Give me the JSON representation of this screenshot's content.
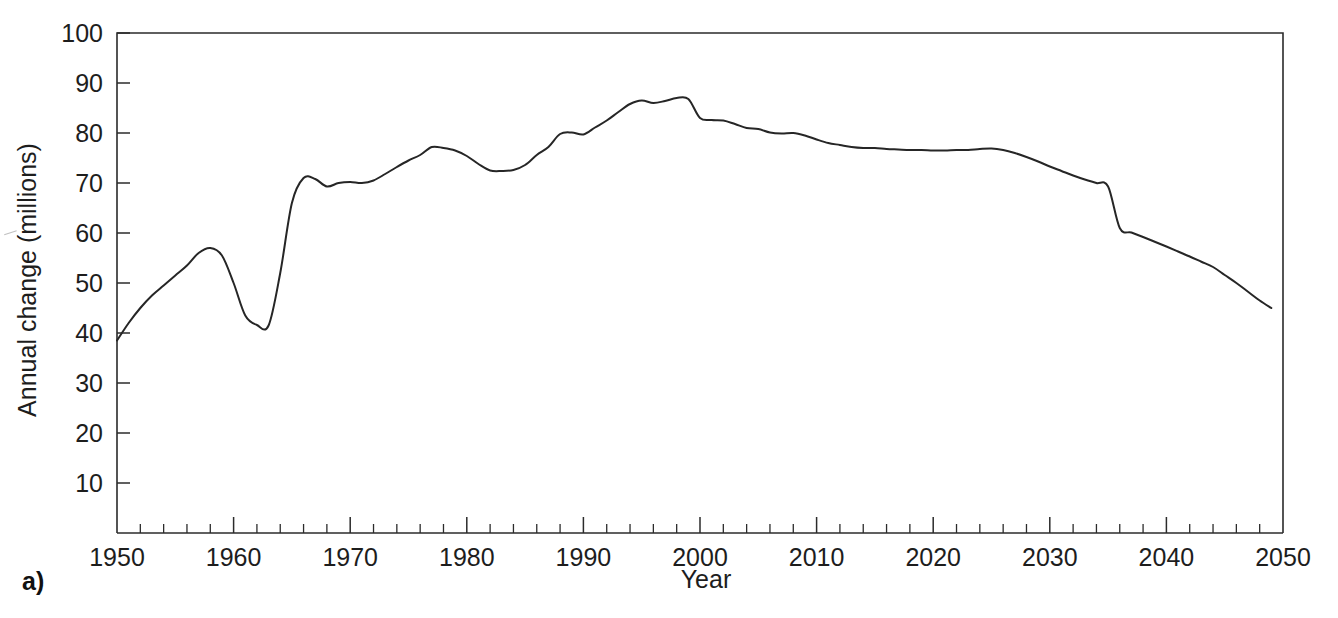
{
  "panel": {
    "label": "a)"
  },
  "chart_data": {
    "type": "line",
    "title": "",
    "xlabel": "Year",
    "ylabel": "Annual change (millions)",
    "xlim": [
      1950,
      2050
    ],
    "ylim": [
      0,
      100
    ],
    "grid": false,
    "legend": null,
    "x_major_ticks": [
      1950,
      1960,
      1970,
      1980,
      1990,
      2000,
      2010,
      2020,
      2030,
      2040,
      2050
    ],
    "x_minor_tick_interval": 2,
    "y_major_ticks": [
      10,
      20,
      30,
      40,
      50,
      60,
      70,
      80,
      90,
      100
    ],
    "x_ticklabels": [
      "1950",
      "1960",
      "1970",
      "1980",
      "1990",
      "2000",
      "2010",
      "2020",
      "2030",
      "2040",
      "2050"
    ],
    "y_ticklabels": [
      "10",
      "20",
      "30",
      "40",
      "50",
      "60",
      "70",
      "80",
      "90",
      "100"
    ],
    "series": [
      {
        "name": "Annual population change",
        "color": "#262626",
        "x": [
          1950,
          1951,
          1952,
          1953,
          1954,
          1955,
          1956,
          1957,
          1958,
          1959,
          1960,
          1961,
          1962,
          1963,
          1964,
          1965,
          1966,
          1967,
          1968,
          1969,
          1970,
          1971,
          1972,
          1973,
          1974,
          1975,
          1976,
          1977,
          1978,
          1979,
          1980,
          1981,
          1982,
          1983,
          1984,
          1985,
          1986,
          1987,
          1988,
          1989,
          1990,
          1991,
          1992,
          1993,
          1994,
          1995,
          1996,
          1997,
          1998,
          1999,
          2000,
          2001,
          2002,
          2003,
          2004,
          2005,
          2006,
          2007,
          2008,
          2009,
          2010,
          2011,
          2012,
          2013,
          2014,
          2015,
          2016,
          2017,
          2018,
          2019,
          2020,
          2021,
          2022,
          2023,
          2024,
          2025,
          2026,
          2027,
          2028,
          2029,
          2030,
          2031,
          2032,
          2033,
          2034,
          2035,
          2036,
          2037,
          2038,
          2039,
          2040,
          2041,
          2042,
          2043,
          2044,
          2045,
          2046,
          2047,
          2048,
          2049
        ],
        "values": [
          38.5,
          42.0,
          45.0,
          47.5,
          49.5,
          51.5,
          53.5,
          56.0,
          57.0,
          55.5,
          50.0,
          43.5,
          41.6,
          41.5,
          52.0,
          66.0,
          71.0,
          70.8,
          69.3,
          70.0,
          70.2,
          70.0,
          70.5,
          71.8,
          73.2,
          74.5,
          75.6,
          77.2,
          77.0,
          76.5,
          75.4,
          73.8,
          72.5,
          72.4,
          72.6,
          73.6,
          75.6,
          77.2,
          79.8,
          80.1,
          79.7,
          81.1,
          82.5,
          84.2,
          85.8,
          86.5,
          86.0,
          86.4,
          87.0,
          86.8,
          83.0,
          82.6,
          82.5,
          81.8,
          81.0,
          80.8,
          80.1,
          79.9,
          80.0,
          79.5,
          78.7,
          78.0,
          77.6,
          77.2,
          77.0,
          77.0,
          76.8,
          76.7,
          76.6,
          76.6,
          76.5,
          76.5,
          76.6,
          76.6,
          76.8,
          76.9,
          76.6,
          76.0,
          75.2,
          74.3,
          73.3,
          72.4,
          71.5,
          70.7,
          70.0,
          69.3,
          68.6,
          67.9,
          67.1,
          66.4,
          65.6,
          64.8,
          64.0,
          63.2,
          62.4,
          61.6,
          61.0,
          60.0,
          58.5,
          56.8
        ]
      }
    ],
    "series_tail": {
      "note": "continued decline to 2049",
      "x": [
        2036,
        2038,
        2040,
        2042,
        2044,
        2046,
        2048,
        2049
      ],
      "values": [
        61.0,
        59.2,
        57.3,
        55.3,
        53.2,
        50.0,
        46.5,
        45.0
      ]
    }
  }
}
